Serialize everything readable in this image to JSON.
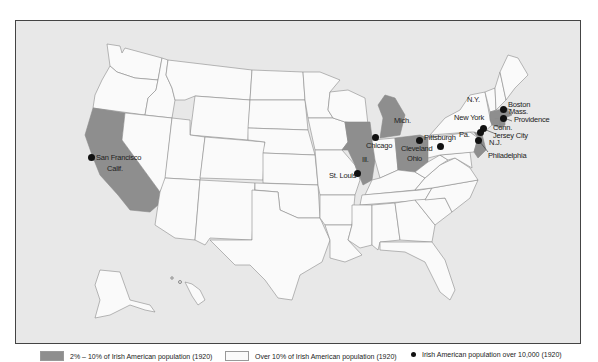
{
  "map": {
    "title": "",
    "colors": {
      "background": "#e8e8e8",
      "highlight_fill": "#8e8e8e",
      "default_fill": "#fafafa",
      "border": "#8a8a8a",
      "city_dot": "#111111"
    },
    "state_labels": {
      "calif": "Calif.",
      "ill": "Ill.",
      "mich": "Mich.",
      "ohio": "Ohio",
      "ny": "N.Y.",
      "pa": "Pa.",
      "nj": "N.J.",
      "conn": "Conn.",
      "mass": "Mass."
    },
    "highlighted_states": [
      "California",
      "Illinois",
      "Michigan",
      "Ohio",
      "Connecticut",
      "Rhode Island",
      "Massachusetts (south)",
      "New Jersey"
    ],
    "cities": [
      {
        "name": "San Francisco"
      },
      {
        "name": "Chicago"
      },
      {
        "name": "St. Louis"
      },
      {
        "name": "Cleveland"
      },
      {
        "name": "Pittsburgh"
      },
      {
        "name": "New York"
      },
      {
        "name": "Jersey City"
      },
      {
        "name": "Philadelphia"
      },
      {
        "name": "Boston"
      },
      {
        "name": "Providence"
      }
    ]
  },
  "legend": {
    "items": [
      {
        "swatch": "dark",
        "label": "2% – 10% of Irish American population (1920)"
      },
      {
        "swatch": "light",
        "label": "Over 10% of Irish American population (1920)"
      },
      {
        "swatch": "dot",
        "label": "Irish American population over 10,000 (1920)"
      }
    ]
  }
}
